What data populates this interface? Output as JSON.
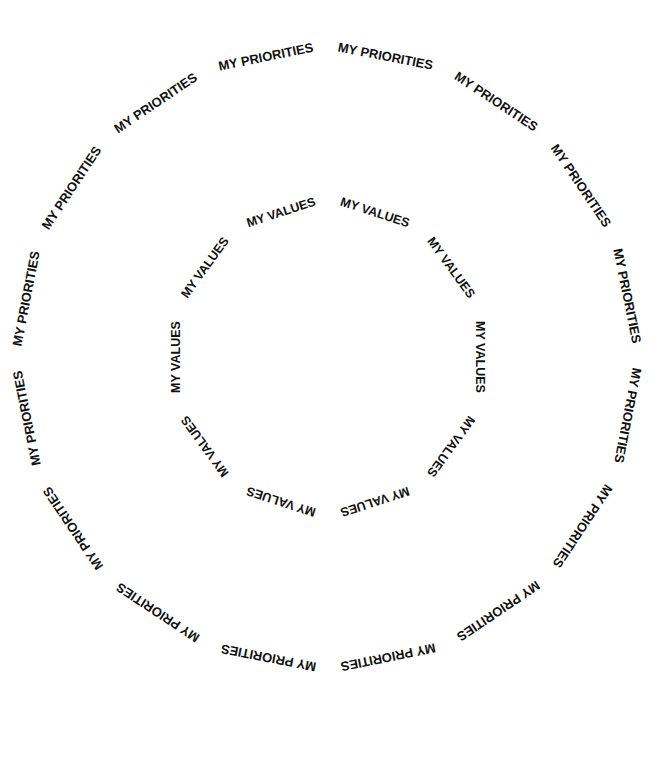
{
  "outer_ring": {
    "label": "MY PRIORITIES",
    "count": 16,
    "cx": 327,
    "cy": 357,
    "r": 302,
    "font_size": 13
  },
  "inner_ring": {
    "label": "MY VALUES",
    "count": 10,
    "cx": 328,
    "cy": 357,
    "r": 148,
    "font_size": 12.5
  },
  "colors": {
    "text": "#111111",
    "background": "#ffffff"
  }
}
